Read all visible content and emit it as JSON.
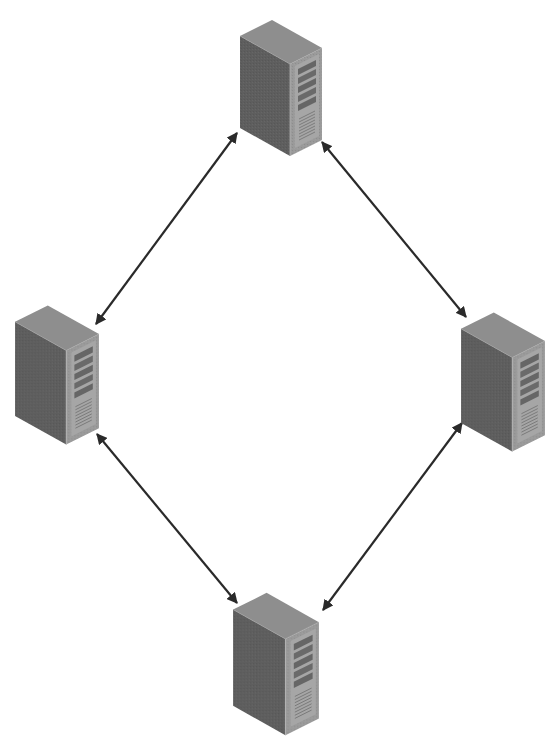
{
  "diagram": {
    "type": "network-topology",
    "layout": "diamond-ring",
    "colors": {
      "background": "#ffffff",
      "arrow": "#2a2a2a",
      "server_top": "#8e8e8e",
      "server_side": "#5e5e5e",
      "server_front": "#9a9a9a",
      "server_slot": "#6a6a6a",
      "server_vent": "#7a7a7a"
    },
    "nodes": [
      {
        "id": "server-top",
        "icon": "server-tower-icon",
        "x": 238,
        "y": 18,
        "width": 86,
        "height": 140
      },
      {
        "id": "server-left",
        "icon": "server-tower-icon",
        "x": 14,
        "y": 300,
        "width": 86,
        "height": 148
      },
      {
        "id": "server-right",
        "icon": "server-tower-icon",
        "x": 460,
        "y": 307,
        "width": 86,
        "height": 148
      },
      {
        "id": "server-bottom",
        "icon": "server-tower-icon",
        "x": 232,
        "y": 592,
        "width": 88,
        "height": 145
      }
    ],
    "edges": [
      {
        "from": "server-left",
        "to": "server-top",
        "bidirectional": true,
        "x1": 96,
        "y1": 324,
        "x2": 237,
        "y2": 133
      },
      {
        "from": "server-top",
        "to": "server-right",
        "bidirectional": true,
        "x1": 322,
        "y1": 142,
        "x2": 466,
        "y2": 317
      },
      {
        "from": "server-left",
        "to": "server-bottom",
        "bidirectional": true,
        "x1": 97,
        "y1": 434,
        "x2": 237,
        "y2": 603
      },
      {
        "from": "server-bottom",
        "to": "server-right",
        "bidirectional": true,
        "x1": 323,
        "y1": 610,
        "x2": 462,
        "y2": 423
      }
    ]
  }
}
